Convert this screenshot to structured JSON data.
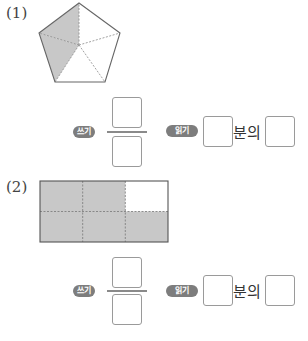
{
  "problems": [
    {
      "number": "(1)",
      "figure": {
        "type": "pentagon",
        "total_parts": 5,
        "shaded_parts": 2,
        "shade_color": "#c8c8c8",
        "outline_color": "#666666"
      },
      "write_badge": "쓰기",
      "read_badge": "읽기",
      "read_connector": "분의",
      "numerator_value": "",
      "denominator_value": "",
      "read_first_value": "",
      "read_second_value": ""
    },
    {
      "number": "(2)",
      "figure": {
        "type": "rectangle-grid",
        "rows": 2,
        "cols": 3,
        "total_parts": 6,
        "shaded_parts": 5,
        "unshaded_cell": "top-right",
        "shade_color": "#c8c8c8",
        "outline_color": "#555555"
      },
      "write_badge": "쓰기",
      "read_badge": "읽기",
      "read_connector": "분의",
      "numerator_value": "",
      "denominator_value": "",
      "read_first_value": "",
      "read_second_value": ""
    }
  ]
}
